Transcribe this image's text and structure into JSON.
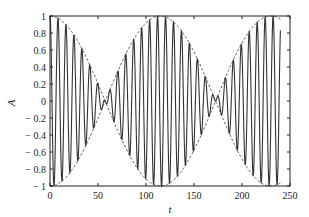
{
  "chart_data": {
    "type": "line",
    "title": "",
    "xlabel": "t",
    "ylabel": "A",
    "xlim": [
      0,
      250
    ],
    "ylim": [
      -1,
      1
    ],
    "xticks": [
      0,
      50,
      100,
      150,
      200,
      250
    ],
    "yticks": [
      1,
      0.8,
      0.6,
      0.4,
      0.2,
      0,
      -0.2,
      -0.4,
      -0.6,
      -0.8,
      -1
    ],
    "xtick_labels": [
      "0",
      "50",
      "100",
      "150",
      "200",
      "250"
    ],
    "ytick_labels": [
      "1",
      "0.8",
      "0.6",
      "0.4",
      "0.2",
      "0",
      "− 0.2",
      "− 0.4",
      "− 0.6",
      "− 0.8",
      "− 1"
    ],
    "grid": false,
    "legend": null,
    "series": [
      {
        "name": "signal",
        "style": "solid",
        "description": "Beating oscillation: A = cos(pi*t/115) * cos(2*pi*t/8.3)",
        "envelope_period": 230,
        "carrier_period": 8.3,
        "t_range": [
          0,
          240
        ],
        "node_locations": [
          57.5,
          172.5
        ],
        "peak_locations": [
          0,
          115,
          230
        ]
      },
      {
        "name": "envelope",
        "style": "dashed",
        "description": "+/- |cos(pi*t/115)|",
        "t_range": [
          0,
          240
        ]
      }
    ],
    "data_end_t": 240
  }
}
